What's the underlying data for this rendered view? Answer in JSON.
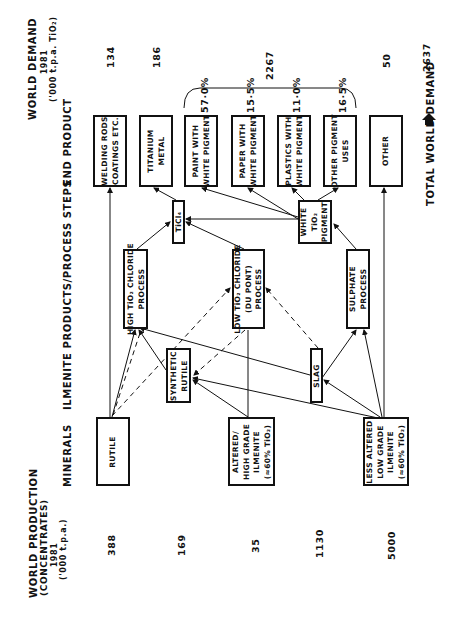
{
  "headers": {
    "world_production": [
      "WORLD PRODUCTION",
      "(CONCENTRATES)",
      "1981",
      "('000 t.p.a.)"
    ],
    "minerals": "MINERALS",
    "process_steps": "ILMENITE PRODUCTS/PROCESS STEPS",
    "end_product": "END PRODUCT",
    "world_demand": [
      "WORLD DEMAND",
      "1981",
      "('000 t.p.a. TiO₂)"
    ]
  },
  "minerals": [
    {
      "id": "rutile",
      "label": [
        "RUTILE"
      ],
      "production": "388"
    },
    {
      "id": "synthetic-rutile-prod",
      "production": "169"
    },
    {
      "id": "altered",
      "label": [
        "ALTERED/",
        "HIGH GRADE",
        "ILMENITE",
        "(≈60% TiO₂)"
      ],
      "production": "35"
    },
    {
      "id": "slag-prod",
      "production": "1130"
    },
    {
      "id": "less-altered",
      "label": [
        "LESS ALTERED",
        "LOW GRADE",
        "ILMENITE",
        "(≈60% TiO₂)"
      ],
      "production": "5000"
    }
  ],
  "intermediates": [
    {
      "id": "synthetic-rutile",
      "label": [
        "SYNTHETIC",
        "RUTILE"
      ]
    },
    {
      "id": "slag",
      "label": [
        "SLAG"
      ]
    }
  ],
  "processes": [
    {
      "id": "high-chloride",
      "label": [
        "HIGH TiO₂ CHLORIDE",
        "PROCESS"
      ]
    },
    {
      "id": "low-chloride",
      "label": [
        "LOW TiO₂ CHLORIDE",
        "(DU PONT)",
        "PROCESS"
      ]
    },
    {
      "id": "sulphate",
      "label": [
        "SULPHATE",
        "PROCESS"
      ]
    },
    {
      "id": "ticl4",
      "label": [
        "TiCl₄"
      ]
    },
    {
      "id": "white-pigment",
      "label": [
        "WHITE",
        "TiO₂",
        "PIGMENT"
      ]
    }
  ],
  "end_products": [
    {
      "id": "welding",
      "label": [
        "WELDING RODS",
        "COATINGS ETC."
      ],
      "demand": "134"
    },
    {
      "id": "titanium-metal",
      "label": [
        "TITANIUM",
        "METAL"
      ],
      "demand": "186"
    },
    {
      "id": "paint",
      "label": [
        "PAINT WITH",
        "WHITE PIGMENT"
      ],
      "share": "57·0%"
    },
    {
      "id": "paper",
      "label": [
        "PAPER WITH",
        "WHITE PIGMENT"
      ],
      "share": "15·5%"
    },
    {
      "id": "plastics",
      "label": [
        "PLASTICS WITH",
        "WHITE PIGMENT"
      ],
      "share": "11·0%"
    },
    {
      "id": "other-pigment",
      "label": [
        "OTHER PIGMENT",
        "USES"
      ],
      "share": "16·5%"
    },
    {
      "id": "other",
      "label": [
        "OTHER"
      ],
      "demand": "50"
    }
  ],
  "pigment_demand_total": "2267",
  "totals": {
    "production_total": "5000",
    "demand_label": "TOTAL WORLD DEMAND",
    "demand_total": "2637"
  }
}
